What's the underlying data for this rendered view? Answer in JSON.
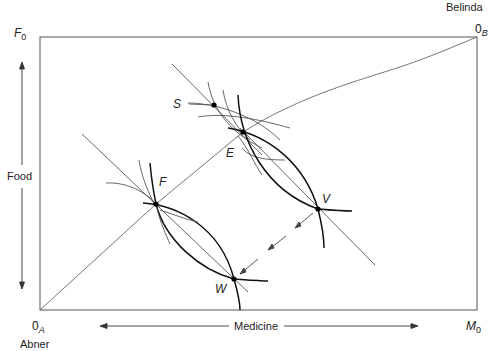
{
  "diagram": {
    "type": "edgeworth-box",
    "owners": {
      "bottom_left": "Abner",
      "top_right": "Belinda"
    },
    "origins": {
      "a": {
        "base": "0",
        "sub": "A"
      },
      "b": {
        "base": "0",
        "sub": "B"
      }
    },
    "axis_ends": {
      "food": {
        "base": "F",
        "sub": "0"
      },
      "medicine": {
        "base": "M",
        "sub": "0"
      }
    },
    "axis_labels": {
      "vertical": "Food",
      "horizontal": "Medicine"
    },
    "points": {
      "S": "S",
      "E": "E",
      "F": "F",
      "V": "V",
      "W": "W"
    },
    "colors": {
      "line": "#555555",
      "heavy": "#111111",
      "background": "#ffffff"
    }
  }
}
